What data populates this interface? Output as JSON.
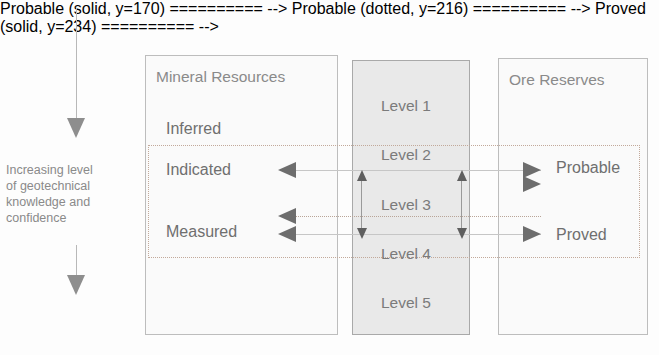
{
  "axis": {
    "caption": "Increasing level\nof geotechnical\nknowledge and\nconfidence",
    "top_arrow": "down-arrow-icon",
    "bottom_arrow": "down-arrow-icon",
    "direction": "down"
  },
  "panels": {
    "mineral_resources": {
      "title": "Mineral Resources",
      "categories": [
        {
          "label": "Inferred"
        },
        {
          "label": "Indicated"
        },
        {
          "label": "Measured"
        }
      ]
    },
    "levels": {
      "items": [
        {
          "label": "Level 1"
        },
        {
          "label": "Level 2"
        },
        {
          "label": "Level 3"
        },
        {
          "label": "Level 4"
        },
        {
          "label": "Level 5"
        }
      ]
    },
    "ore_reserves": {
      "title": "Ore Reserves",
      "categories": [
        {
          "label": "Probable"
        },
        {
          "label": "Proved"
        }
      ]
    }
  },
  "colors": {
    "panel_fill_light": "#fafafa",
    "panel_fill_level": "#e9e9e9",
    "panel_border": "#bdbdbd",
    "text_gray": "#6f6f6f",
    "title_gray": "#8a8a8a",
    "arrow_gray": "#6d6d6d",
    "dashed_band": "#c2a99a",
    "connector": "#c6c6c6"
  }
}
